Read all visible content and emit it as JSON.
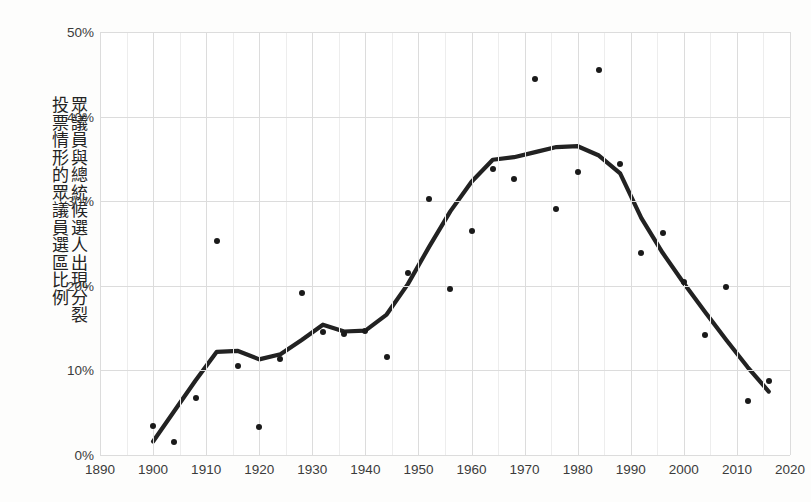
{
  "chart_data": {
    "type": "scatter",
    "title": "",
    "subtitle": "",
    "xlabel": "",
    "ylabel_columns": [
      "眾議員與總統候選人出現分裂",
      "投票情形的眾議員選區比例"
    ],
    "ylabel": "眾議員與總統候選人出現分裂投票情形的眾議員選區比例",
    "xlim": [
      1890,
      2020
    ],
    "ylim": [
      0,
      50
    ],
    "xticks": [
      1890,
      1900,
      1910,
      1920,
      1930,
      1940,
      1950,
      1960,
      1970,
      1980,
      1990,
      2000,
      2010,
      2020
    ],
    "xtick_labels": [
      "1890",
      "1900",
      "1910",
      "1920",
      "1930",
      "1940",
      "1950",
      "1960",
      "1970",
      "1980",
      "1990",
      "2000",
      "2010",
      "2020"
    ],
    "yticks": [
      0,
      10,
      20,
      30,
      40,
      50
    ],
    "ytick_labels": [
      "0%",
      "10%",
      "20%",
      "30%",
      "40%",
      "50%"
    ],
    "grid": true,
    "legend": null,
    "point_color": "#1a1a1a",
    "line_color": "#222222",
    "grid_color": "#dcdcdc",
    "background": "#ffffff",
    "x": [
      1900,
      1904,
      1908,
      1912,
      1916,
      1920,
      1924,
      1928,
      1932,
      1936,
      1940,
      1944,
      1948,
      1952,
      1956,
      1960,
      1964,
      1968,
      1972,
      1976,
      1980,
      1984,
      1988,
      1992,
      1996,
      2000,
      2004,
      2008,
      2012,
      2016
    ],
    "values": [
      3.4,
      1.5,
      6.7,
      25.3,
      10.5,
      3.3,
      11.4,
      19.2,
      14.5,
      14.3,
      14.6,
      11.6,
      21.5,
      30.3,
      19.6,
      26.5,
      33.8,
      32.6,
      44.5,
      29.1,
      33.4,
      45.5,
      34.4,
      23.9,
      26.2,
      20.4,
      14.2,
      19.8,
      6.4,
      8.7
    ],
    "series": [
      {
        "name": "分裂投票選區比例",
        "type": "scatter",
        "points": [
          {
            "x": 1900,
            "y": 3.4
          },
          {
            "x": 1904,
            "y": 1.5
          },
          {
            "x": 1908,
            "y": 6.7
          },
          {
            "x": 1912,
            "y": 25.3
          },
          {
            "x": 1916,
            "y": 10.5
          },
          {
            "x": 1920,
            "y": 3.3
          },
          {
            "x": 1924,
            "y": 11.4
          },
          {
            "x": 1928,
            "y": 19.2
          },
          {
            "x": 1932,
            "y": 14.5
          },
          {
            "x": 1936,
            "y": 14.3
          },
          {
            "x": 1940,
            "y": 14.6
          },
          {
            "x": 1944,
            "y": 11.6
          },
          {
            "x": 1948,
            "y": 21.5
          },
          {
            "x": 1952,
            "y": 30.3
          },
          {
            "x": 1956,
            "y": 19.6
          },
          {
            "x": 1960,
            "y": 26.5
          },
          {
            "x": 1964,
            "y": 33.8
          },
          {
            "x": 1968,
            "y": 32.6
          },
          {
            "x": 1972,
            "y": 44.5
          },
          {
            "x": 1976,
            "y": 29.1
          },
          {
            "x": 1980,
            "y": 33.4
          },
          {
            "x": 1984,
            "y": 45.5
          },
          {
            "x": 1988,
            "y": 34.4
          },
          {
            "x": 1992,
            "y": 23.9
          },
          {
            "x": 1996,
            "y": 26.2
          },
          {
            "x": 2000,
            "y": 20.4
          },
          {
            "x": 2004,
            "y": 14.2
          },
          {
            "x": 2008,
            "y": 19.8
          },
          {
            "x": 2012,
            "y": 6.4
          },
          {
            "x": 2016,
            "y": 8.7
          }
        ]
      },
      {
        "name": "平滑趨勢線",
        "type": "line",
        "points": [
          {
            "x": 1900,
            "y": 1.6
          },
          {
            "x": 1904,
            "y": 5.2
          },
          {
            "x": 1908,
            "y": 8.8
          },
          {
            "x": 1912,
            "y": 12.2
          },
          {
            "x": 1916,
            "y": 12.3
          },
          {
            "x": 1920,
            "y": 11.3
          },
          {
            "x": 1924,
            "y": 11.9
          },
          {
            "x": 1928,
            "y": 13.6
          },
          {
            "x": 1932,
            "y": 15.4
          },
          {
            "x": 1936,
            "y": 14.6
          },
          {
            "x": 1940,
            "y": 14.7
          },
          {
            "x": 1944,
            "y": 16.6
          },
          {
            "x": 1948,
            "y": 20.2
          },
          {
            "x": 1952,
            "y": 24.6
          },
          {
            "x": 1956,
            "y": 28.8
          },
          {
            "x": 1960,
            "y": 32.3
          },
          {
            "x": 1964,
            "y": 34.9
          },
          {
            "x": 1968,
            "y": 35.2
          },
          {
            "x": 1972,
            "y": 35.8
          },
          {
            "x": 1976,
            "y": 36.4
          },
          {
            "x": 1980,
            "y": 36.5
          },
          {
            "x": 1984,
            "y": 35.4
          },
          {
            "x": 1988,
            "y": 33.3
          },
          {
            "x": 1992,
            "y": 28.0
          },
          {
            "x": 1996,
            "y": 23.9
          },
          {
            "x": 2000,
            "y": 20.3
          },
          {
            "x": 2004,
            "y": 16.9
          },
          {
            "x": 2008,
            "y": 13.6
          },
          {
            "x": 2012,
            "y": 10.4
          },
          {
            "x": 2016,
            "y": 7.5
          }
        ]
      }
    ]
  }
}
